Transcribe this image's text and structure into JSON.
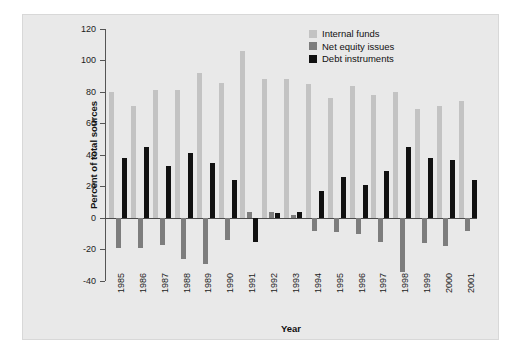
{
  "chart_data": {
    "type": "bar",
    "title": "",
    "xlabel": "Year",
    "ylabel": "Percent of total sources",
    "ylim": [
      -40,
      120
    ],
    "ytick_step": 20,
    "yticks": [
      120,
      100,
      80,
      60,
      40,
      20,
      0,
      -20,
      -40
    ],
    "ytick_labels": [
      "120",
      "100",
      "80",
      "60",
      "40",
      "20",
      "0",
      "-20",
      "-40"
    ],
    "grid": false,
    "legend_position": "top-right",
    "categories": [
      "1985",
      "1986",
      "1987",
      "1988",
      "1989",
      "1990",
      "1991",
      "1992",
      "1993",
      "1994",
      "1995",
      "1996",
      "1997",
      "1998",
      "1999",
      "2000",
      "2001"
    ],
    "series": [
      {
        "name": "Internal funds",
        "color": "#c3c3c3",
        "values": [
          80,
          71,
          81,
          81,
          92,
          86,
          106,
          88,
          88,
          85,
          76,
          84,
          78,
          80,
          69,
          71,
          74
        ]
      },
      {
        "name": "Net equity issues",
        "color": "#7d7d7d",
        "values": [
          -19,
          -19,
          -17,
          -26,
          -29,
          -14,
          4,
          4,
          2,
          -8,
          -9,
          -10,
          -15,
          -34,
          -16,
          -18,
          -8
        ]
      },
      {
        "name": "Debt instruments",
        "color": "#111111",
        "values": [
          38,
          45,
          33,
          41,
          35,
          24,
          -15,
          3,
          4,
          17,
          26,
          21,
          30,
          45,
          38,
          37,
          24
        ]
      }
    ]
  },
  "legend": {
    "items": [
      {
        "label": "Internal funds",
        "color": "#c3c3c3"
      },
      {
        "label": "Net equity issues",
        "color": "#7d7d7d"
      },
      {
        "label": "Debt instruments",
        "color": "#111111"
      }
    ]
  },
  "axes": {
    "y_title": "Percent of total sources",
    "x_title": "Year"
  }
}
